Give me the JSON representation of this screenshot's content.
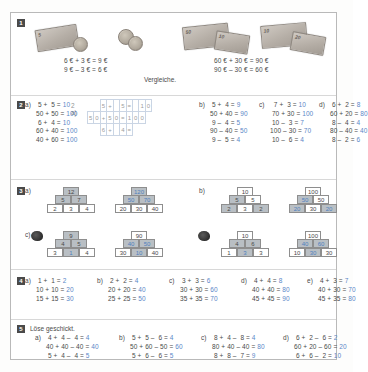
{
  "worksheet": {
    "title": "Rechnen mit Euro - Ubungsblatt",
    "accent_color": "#5b87c7",
    "box_number_color": "#4a4a4a"
  },
  "task1": {
    "number": "1",
    "caption": "Vergleiche.",
    "left": {
      "equations": [
        "6 € + 3 € = 9 €",
        "9 € – 3 € = 6 €"
      ],
      "money": [
        "5-euro-note",
        "1-euro-coin",
        "2-euro-coin",
        "1-euro-coin"
      ]
    },
    "right": {
      "equations": [
        "60 € + 30 € = 90 €",
        "90 € – 30 € = 60 €"
      ],
      "money": [
        "50-euro-note",
        "10-euro-note",
        "10-euro-note",
        "20-euro-note"
      ]
    }
  },
  "task2": {
    "number": "2",
    "columns": [
      {
        "label": "a)",
        "rows": [
          {
            "left": " 5 +  5 =",
            "result": "10"
          },
          {
            "left": "50 + 50 =",
            "result": "100"
          },
          {
            "left": " 6 +  4 =",
            "result": "10"
          },
          {
            "left": "60 + 40 =",
            "result": "100"
          },
          {
            "left": "40 + 60 =",
            "result": "100"
          }
        ]
      },
      {
        "label": "b)",
        "rows": [
          {
            "left": " 5 +  4 =",
            "result": "9"
          },
          {
            "left": "50 + 40 =",
            "result": "90"
          },
          {
            "left": " 9 –  4 =",
            "result": "5"
          },
          {
            "left": "90 – 40 =",
            "result": "50"
          },
          {
            "left": " 9 –  5 =",
            "result": "4"
          }
        ]
      },
      {
        "label": "c)",
        "rows": [
          {
            "left": "  7 +  3 =",
            "result": "10"
          },
          {
            "left": " 70 + 30 =",
            "result": "100"
          },
          {
            "left": " 10 –  3 =",
            "result": "7"
          },
          {
            "left": "100 – 30 =",
            "result": "70"
          },
          {
            "left": " 10 –  6 =",
            "result": "4"
          }
        ]
      },
      {
        "label": "d)",
        "rows": [
          {
            "left": " 6 +  2 =",
            "result": "8"
          },
          {
            "left": "60 + 20 =",
            "result": "80"
          },
          {
            "left": " 8 –  4 =",
            "result": "4"
          },
          {
            "left": "80 – 40 =",
            "result": "40"
          },
          {
            "left": " 8 –  2 =",
            "result": "6"
          }
        ]
      }
    ],
    "overlay": {
      "label": "2 a)",
      "row1": [
        "5",
        "+",
        "",
        "5",
        "=",
        "",
        "1",
        "0"
      ],
      "row2": [
        "5",
        "0",
        "+",
        "5",
        "0",
        "=",
        "1",
        "0",
        "0"
      ],
      "row3": [
        "6",
        "+",
        "",
        "4",
        "="
      ]
    }
  },
  "task3": {
    "number": "3",
    "items": [
      {
        "label": "a)",
        "pyramids": [
          {
            "top": "12",
            "mid": [
              "5",
              "7"
            ],
            "base": [
              "2",
              "3",
              "4"
            ],
            "top_style": "g",
            "mid_style": [
              "g",
              "g"
            ],
            "base_style": [
              "w",
              "w",
              "w"
            ]
          },
          {
            "top": "120",
            "mid": [
              "50",
              "70"
            ],
            "base": [
              "20",
              "30",
              "40"
            ],
            "top_style": "gb",
            "mid_style": [
              "gb",
              "gb"
            ],
            "base_style": [
              "w",
              "w",
              "w"
            ]
          }
        ]
      },
      {
        "label": "b)",
        "pyramids": [
          {
            "top": "10",
            "mid": [
              "5",
              "5"
            ],
            "base": [
              "2",
              "3",
              "2"
            ],
            "top_style": "w",
            "mid_style": [
              "g",
              "w"
            ],
            "base_style": [
              "g",
              "w",
              "g"
            ]
          },
          {
            "top": "100",
            "mid": [
              "50",
              "50"
            ],
            "base": [
              "20",
              "30",
              "20"
            ],
            "top_style": "w",
            "mid_style": [
              "gb",
              "w"
            ],
            "base_style": [
              "gb",
              "w",
              "gb"
            ]
          }
        ]
      },
      {
        "label": "c)",
        "pyramids": [
          {
            "top": "9",
            "mid": [
              "4",
              "5"
            ],
            "base": [
              "3",
              "1",
              "4"
            ],
            "top_style": "g",
            "mid_style": [
              "g",
              "g"
            ],
            "base_style": [
              "w",
              "gb",
              "w"
            ]
          },
          {
            "top": "90",
            "mid": [
              "40",
              "50"
            ],
            "base": [
              "30",
              "10",
              "40"
            ],
            "top_style": "w",
            "mid_style": [
              "gb",
              "gb"
            ],
            "base_style": [
              "w",
              "gb",
              "w"
            ]
          }
        ]
      },
      {
        "label": "d)",
        "pyramids": [
          {
            "top": "10",
            "mid": [
              "4",
              "6"
            ],
            "base": [
              "1",
              "3",
              "3"
            ],
            "top_style": "w",
            "mid_style": [
              "g",
              "g"
            ],
            "base_style": [
              "w",
              "gb",
              "w"
            ]
          },
          {
            "top": "100",
            "mid": [
              "40",
              "60"
            ],
            "base": [
              "10",
              "30",
              "30"
            ],
            "top_style": "w",
            "mid_style": [
              "gb",
              "gb"
            ],
            "base_style": [
              "w",
              "gb",
              "w"
            ]
          }
        ]
      }
    ]
  },
  "task4": {
    "number": "4",
    "columns": [
      {
        "label": "a)",
        "rows": [
          {
            "left": " 1 +  1 =",
            "result": "2"
          },
          {
            "left": "10 + 10 =",
            "result": "20"
          },
          {
            "left": "15 + 15 =",
            "result": "30"
          }
        ]
      },
      {
        "label": "b)",
        "rows": [
          {
            "left": " 2 +  2 =",
            "result": "4"
          },
          {
            "left": "20 + 20 =",
            "result": "40"
          },
          {
            "left": "25 + 25 =",
            "result": "50"
          }
        ]
      },
      {
        "label": "c)",
        "rows": [
          {
            "left": " 3 +  3 =",
            "result": "6"
          },
          {
            "left": "30 + 30 =",
            "result": "60"
          },
          {
            "left": "35 + 35 =",
            "result": "70"
          }
        ]
      },
      {
        "label": "d)",
        "rows": [
          {
            "left": " 4 +  4 =",
            "result": "8"
          },
          {
            "left": "40 + 40 =",
            "result": "80"
          },
          {
            "left": "45 + 45 =",
            "result": "90"
          }
        ]
      },
      {
        "label": "e)",
        "rows": [
          {
            "left": " 4 +  3 =",
            "result": "7"
          },
          {
            "left": "40 + 30 =",
            "result": "70"
          },
          {
            "left": "45 + 35 =",
            "result": "80"
          }
        ]
      }
    ]
  },
  "task5": {
    "number": "5",
    "instruction": "Löse geschickt.",
    "columns": [
      {
        "label": "a)",
        "rows": [
          {
            "left": " 4 +  4 –  4 =",
            "result": "4"
          },
          {
            "left": "40 + 40 – 40 =",
            "result": "40"
          },
          {
            "left": " 5 +  4 –  4 =",
            "result": "5"
          }
        ]
      },
      {
        "label": "b)",
        "rows": [
          {
            "left": " 5 +  5 –  6 =",
            "result": "4"
          },
          {
            "left": "50 + 60 – 50 =",
            "result": "60"
          },
          {
            "left": " 5 +  6 –  6 =",
            "result": "5"
          }
        ]
      },
      {
        "label": "c)",
        "rows": [
          {
            "left": " 8 +  4 –  8 =",
            "result": "4"
          },
          {
            "left": "80 + 40 – 40 =",
            "result": "80"
          },
          {
            "left": " 8 +  8 –  7 =",
            "result": "9"
          }
        ]
      },
      {
        "label": "d)",
        "rows": [
          {
            "left": " 6 +  2 –  6 =",
            "result": "2"
          },
          {
            "left": "60 + 20 – 60 =",
            "result": "20"
          },
          {
            "left": " 6 +  6 –  2 =",
            "result": "10"
          }
        ]
      }
    ]
  }
}
